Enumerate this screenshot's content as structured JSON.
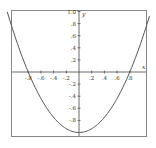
{
  "chart_data": {
    "type": "line",
    "title": "",
    "xlabel": "x",
    "ylabel": "y",
    "xlim": [
      -1.05,
      1.05
    ],
    "ylim": [
      -1.05,
      1.05
    ],
    "grid": false,
    "legend": null,
    "x_ticks": [
      -0.8,
      -0.6,
      -0.4,
      -0.2,
      0.2,
      0.4,
      0.6,
      0.8
    ],
    "x_tick_labels": [
      "-.8",
      "-.6",
      "-.4",
      "-.2",
      ".2",
      ".4",
      ".6",
      ".8"
    ],
    "y_ticks": [
      1.0,
      0.8,
      0.6,
      0.4,
      0.2,
      -0.2,
      -0.4,
      -0.6,
      -0.8
    ],
    "y_tick_labels": [
      "1.0",
      ".8",
      ".6",
      ".4",
      ".2",
      "-.2",
      "-.4",
      "-.6",
      "-.8"
    ],
    "series": [
      {
        "name": "parabola",
        "x": [
          -1.1,
          -1.0,
          -0.8,
          -0.6,
          -0.4,
          -0.2,
          0.0,
          0.2,
          0.4,
          0.6,
          0.8,
          1.0,
          1.1
        ],
        "y": [
          0.89,
          0.56,
          0.0,
          -0.44,
          -0.75,
          -0.94,
          -1.0,
          -0.94,
          -0.75,
          -0.44,
          0.0,
          0.56,
          0.89
        ]
      }
    ]
  },
  "colors": {
    "frame": "#888888",
    "axis": "#444444",
    "curve": "#555555",
    "background": "#ffffff"
  }
}
